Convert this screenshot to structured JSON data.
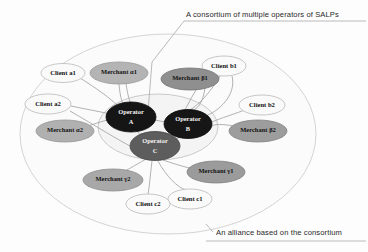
{
  "figure": {
    "type": "network-diagram",
    "background_color": "#fdfdfd"
  },
  "annotations": {
    "top_caption": "A consortium of multiple operators of SALPs",
    "bottom_caption": "An alliance based on the consortium"
  },
  "regions": [
    {
      "id": "alliance-ellipse",
      "label": "An alliance based on the consortium",
      "cx": 168,
      "cy": 134,
      "rx": 148,
      "ry": 100,
      "fill": "#fbfbfb",
      "stroke": "#cfcfcf"
    },
    {
      "id": "consortium-ellipse",
      "label": "A consortium of multiple operators of SALPs",
      "cx": 158,
      "cy": 127,
      "rx": 60,
      "ry": 33,
      "fill": "#f4f4f4",
      "stroke": "#c4c4c4"
    }
  ],
  "nodes": [
    {
      "id": "operator-a",
      "label_line1": "Operator",
      "label_line2": "A",
      "kind": "operator",
      "cx": 131,
      "cy": 117,
      "rx": 25,
      "ry": 15,
      "fill": "#151515",
      "stroke": "#0a0a0a",
      "text_class": "t-dark"
    },
    {
      "id": "operator-b",
      "label_line1": "Operator",
      "label_line2": "B",
      "kind": "operator",
      "cx": 188,
      "cy": 124,
      "rx": 24,
      "ry": 14.5,
      "fill": "#161616",
      "stroke": "#0a0a0a",
      "text_class": "t-dark"
    },
    {
      "id": "operator-c",
      "label_line1": "Operator",
      "label_line2": "C",
      "kind": "operator",
      "cx": 155,
      "cy": 146,
      "rx": 25,
      "ry": 14.5,
      "fill": "#5d5d5d",
      "stroke": "#474747",
      "text_class": "t-dark"
    },
    {
      "id": "client-a1",
      "label_line1": "Client a1",
      "label_line2": "",
      "kind": "client",
      "cx": 63,
      "cy": 73,
      "rx": 22,
      "ry": 9.5,
      "fill": "#fafafa",
      "stroke": "#b9b9b9",
      "text_class": "t-light"
    },
    {
      "id": "client-a2",
      "label_line1": "Client a2",
      "label_line2": "",
      "kind": "client",
      "cx": 48,
      "cy": 104,
      "rx": 23,
      "ry": 10,
      "fill": "#fafafa",
      "stroke": "#b9b9b9",
      "text_class": "t-light"
    },
    {
      "id": "merchant-a1",
      "label_line1": "Merchant α1",
      "label_line2": "",
      "kind": "merchant",
      "cx": 119,
      "cy": 73,
      "rx": 29,
      "ry": 11,
      "fill": "#b4b4b4",
      "stroke": "#9a9a9a",
      "text_class": "t-mid"
    },
    {
      "id": "merchant-a2",
      "label_line1": "Merchant α2",
      "label_line2": "",
      "kind": "merchant",
      "cx": 65,
      "cy": 131,
      "rx": 29,
      "ry": 11,
      "fill": "#b0b0b0",
      "stroke": "#979797",
      "text_class": "t-mid"
    },
    {
      "id": "client-b1",
      "label_line1": "Client b1",
      "label_line2": "",
      "kind": "client",
      "cx": 224,
      "cy": 66,
      "rx": 22,
      "ry": 10,
      "fill": "#fafafa",
      "stroke": "#b9b9b9",
      "text_class": "t-light"
    },
    {
      "id": "client-b2",
      "label_line1": "Client b2",
      "label_line2": "",
      "kind": "client",
      "cx": 262,
      "cy": 105,
      "rx": 23,
      "ry": 10,
      "fill": "#fafafa",
      "stroke": "#b9b9b9",
      "text_class": "t-light"
    },
    {
      "id": "merchant-b1",
      "label_line1": "Merchant β1",
      "label_line2": "",
      "kind": "merchant",
      "cx": 190,
      "cy": 79,
      "rx": 29,
      "ry": 11,
      "fill": "#8f8f8f",
      "stroke": "#767676",
      "text_class": "t-mid"
    },
    {
      "id": "merchant-b2",
      "label_line1": "Merchant β2",
      "label_line2": "",
      "kind": "merchant",
      "cx": 258,
      "cy": 131,
      "rx": 29,
      "ry": 11,
      "fill": "#9d9d9d",
      "stroke": "#848484",
      "text_class": "t-mid"
    },
    {
      "id": "client-c1",
      "label_line1": "Client c1",
      "label_line2": "",
      "kind": "client",
      "cx": 190,
      "cy": 199,
      "rx": 22,
      "ry": 10,
      "fill": "#fafafa",
      "stroke": "#b9b9b9",
      "text_class": "t-light"
    },
    {
      "id": "client-c2",
      "label_line1": "Client c2",
      "label_line2": "",
      "kind": "client",
      "cx": 148,
      "cy": 204,
      "rx": 22,
      "ry": 10,
      "fill": "#fafafa",
      "stroke": "#b9b9b9",
      "text_class": "t-light"
    },
    {
      "id": "merchant-c1",
      "label_line1": "Merchant γ1",
      "label_line2": "",
      "kind": "merchant",
      "cx": 216,
      "cy": 172,
      "rx": 29,
      "ry": 11,
      "fill": "#9b9b9b",
      "stroke": "#828282",
      "text_class": "t-mid"
    },
    {
      "id": "merchant-c2",
      "label_line1": "Merchant γ2",
      "label_line2": "",
      "kind": "merchant",
      "cx": 113,
      "cy": 180,
      "rx": 30,
      "ry": 11,
      "fill": "#a8a8a8",
      "stroke": "#8f8f8f",
      "text_class": "t-mid"
    }
  ],
  "edges": [
    {
      "from": "merchant-a1",
      "to": "operator-a",
      "path": "M119,84 C120,96 122,104 124,103"
    },
    {
      "from": "merchant-a1",
      "to": "operator-a",
      "path": "M126,84 C128,96 130,104 131,102"
    },
    {
      "from": "client-a1",
      "to": "operator-a",
      "path": "M80,78 C96,88 110,98 118,106"
    },
    {
      "from": "client-a2",
      "to": "operator-a",
      "path": "M71,106 C90,110 102,112 110,114"
    },
    {
      "from": "merchant-a2",
      "to": "operator-a",
      "path": "M88,126 C100,122 110,119 115,118"
    },
    {
      "from": "client-a2",
      "to": "operator-c",
      "path": "M70,111 C96,126 118,140 132,147"
    },
    {
      "from": "merchant-b1",
      "to": "operator-b",
      "path": "M196,90 C190,100 186,108 185,110"
    },
    {
      "from": "merchant-b1",
      "to": "operator-b",
      "path": "M205,87 C204,98 200,108 192,111"
    },
    {
      "from": "client-b1",
      "to": "operator-b",
      "path": "M220,76 C212,90 200,104 190,110"
    },
    {
      "from": "client-b1",
      "to": "operator-b",
      "path": "M232,76 C236,92 224,108 206,116"
    },
    {
      "from": "client-b2",
      "to": "operator-b",
      "path": "M245,110 C228,116 216,120 212,122"
    },
    {
      "from": "merchant-b2",
      "to": "operator-b",
      "path": "M234,126 C222,124 215,124 212,126"
    },
    {
      "from": "operator-c",
      "to": "client-c2",
      "path": "M152,161 C150,178 149,190 148,194"
    },
    {
      "from": "operator-c",
      "to": "client-c1",
      "path": "M158,161 C166,176 178,188 186,190"
    },
    {
      "from": "operator-c",
      "to": "merchant-c1",
      "path": "M163,160 C180,166 196,170 204,171"
    },
    {
      "from": "operator-c",
      "to": "merchant-c2",
      "path": "M146,159 C134,166 124,172 118,174"
    },
    {
      "from": "operator-a",
      "to": "operator-b",
      "path": "M155,120 C164,122 172,123 178,123"
    },
    {
      "from": "operator-a",
      "to": "operator-c",
      "path": "M137,131 C142,137 146,141 149,143"
    },
    {
      "from": "operator-b",
      "to": "operator-c",
      "path": "M181,136 C174,141 170,143 167,145"
    }
  ],
  "leader_lines": [
    {
      "id": "top-leader",
      "path": "M184,21 L152,62 L148,112"
    },
    {
      "id": "top-underline",
      "path": "M184,21 L366,21"
    },
    {
      "id": "bottom-leader",
      "path": "M213,232 L206,224"
    },
    {
      "id": "bottom-underline",
      "path": "M206,241 L366,241"
    }
  ]
}
